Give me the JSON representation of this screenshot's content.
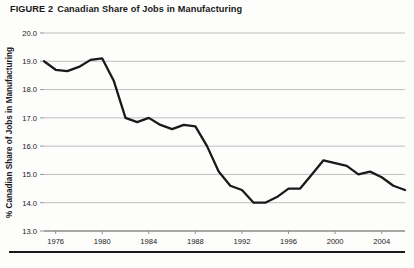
{
  "figure": {
    "label": "FIGURE 2",
    "title": "Canadian Share of Jobs in Manufacturing"
  },
  "colors": {
    "line": "#1a1a1a",
    "gridline": "#b9b9b9",
    "axis": "#8a8a8a",
    "text": "#1a1a1a",
    "background": "#fdfdfc",
    "rule": "#1a1a1a"
  },
  "chart_data": {
    "type": "line",
    "title": "Canadian Share of Jobs in Manufacturing",
    "xlabel": "",
    "ylabel": "% Canadian Share of Jobs in Manufacturing",
    "xlim": [
      1975,
      2006
    ],
    "ylim": [
      13.0,
      20.0
    ],
    "grid": true,
    "legend": false,
    "y_ticks": [
      "20.0",
      "19.0",
      "18.0",
      "17.0",
      "16.0",
      "15.0",
      "14.0",
      "13.0"
    ],
    "y_tick_values": [
      20.0,
      19.0,
      18.0,
      17.0,
      16.0,
      15.0,
      14.0,
      13.0
    ],
    "x_ticks": [
      "1976",
      "1980",
      "1984",
      "1988",
      "1992",
      "1996",
      "2000",
      "2004"
    ],
    "x_tick_values": [
      1976,
      1980,
      1984,
      1988,
      1992,
      1996,
      2000,
      2004
    ],
    "x": [
      1975,
      1976,
      1977,
      1978,
      1979,
      1980,
      1981,
      1982,
      1983,
      1984,
      1985,
      1986,
      1987,
      1988,
      1989,
      1990,
      1991,
      1992,
      1993,
      1994,
      1995,
      1996,
      1997,
      1998,
      1999,
      2000,
      2001,
      2002,
      2003,
      2004,
      2005,
      2006
    ],
    "values": [
      19.0,
      18.7,
      18.65,
      18.8,
      19.05,
      19.1,
      18.3,
      17.0,
      16.85,
      17.0,
      16.75,
      16.6,
      16.75,
      16.7,
      16.0,
      15.1,
      14.6,
      14.45,
      14.0,
      14.0,
      14.2,
      14.5,
      14.5,
      15.0,
      15.5,
      15.4,
      15.3,
      15.0,
      15.1,
      14.9,
      14.6,
      14.45
    ],
    "series": [
      {
        "name": "Canadian share of jobs in manufacturing",
        "values": [
          19.0,
          18.7,
          18.65,
          18.8,
          19.05,
          19.1,
          18.3,
          17.0,
          16.85,
          17.0,
          16.75,
          16.6,
          16.75,
          16.7,
          16.0,
          15.1,
          14.6,
          14.45,
          14.0,
          14.0,
          14.2,
          14.5,
          14.5,
          15.0,
          15.5,
          15.4,
          15.3,
          15.0,
          15.1,
          14.9,
          14.6,
          14.45
        ]
      }
    ]
  }
}
